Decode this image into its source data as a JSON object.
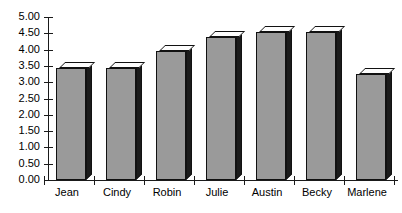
{
  "chart_data": {
    "type": "bar",
    "title": "",
    "subtitle": "",
    "xlabel": "",
    "ylabel": "",
    "categories": [
      "Jean",
      "Cindy",
      "Robin",
      "Julie",
      "Austin",
      "Becky",
      "Marlene"
    ],
    "values": [
      3.45,
      3.45,
      3.95,
      4.4,
      4.55,
      4.55,
      3.25
    ],
    "series": [
      {
        "name": "",
        "values": [
          3.45,
          3.45,
          3.95,
          4.4,
          4.55,
          4.55,
          3.25
        ]
      }
    ],
    "ylim": [
      0,
      5
    ],
    "ytick_labels": [
      "0.00",
      "0.50",
      "1.00",
      "1.50",
      "2.00",
      "2.50",
      "3.00",
      "3.50",
      "4.00",
      "4.50",
      "5.00"
    ],
    "ytick_values": [
      0,
      0.5,
      1,
      1.5,
      2,
      2.5,
      3,
      3.5,
      4,
      4.5,
      5
    ],
    "ytick_step": 0.5,
    "grid": false,
    "legend": false,
    "legend_position": "none",
    "style": "3d-column",
    "colors": {
      "bar_front": "#9a9a9a",
      "bar_top": "#fdfdfd",
      "bar_side": "#1b1b1b",
      "axis": "#1a1a1a",
      "text": "#000000",
      "background": "#ffffff"
    }
  },
  "title_clipped": {
    "text": "",
    "note": ""
  }
}
